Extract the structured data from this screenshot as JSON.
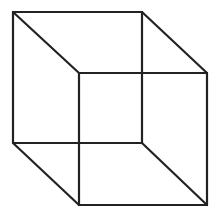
{
  "diagram": {
    "type": "wireframe-cube",
    "stroke_color": "#222222",
    "background": "#ffffff",
    "square_front": {
      "x1": 13,
      "y1": 12,
      "x2": 142,
      "y2": 143
    },
    "square_back": {
      "x1": 79,
      "y1": 73,
      "x2": 207,
      "y2": 205
    }
  }
}
